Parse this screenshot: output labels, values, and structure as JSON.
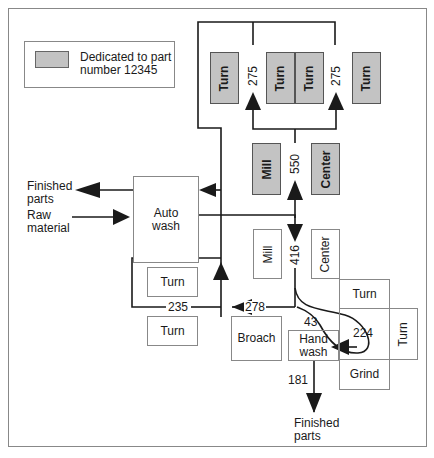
{
  "legend": {
    "label_line1": "Dedicated to part",
    "label_line2": "number 12345",
    "swatch_color": "#c3c3c3"
  },
  "dedicated_cell": {
    "machines": [
      {
        "label": "Turn",
        "dedicated": true
      },
      {
        "label": "Turn",
        "dedicated": true
      },
      {
        "label": "Turn",
        "dedicated": true
      },
      {
        "label": "Turn",
        "dedicated": true
      },
      {
        "label": "Mill",
        "dedicated": true
      },
      {
        "label": "Center",
        "dedicated": true
      }
    ],
    "flows": {
      "left_branch": "275",
      "right_branch": "275",
      "trunk": "550"
    }
  },
  "auto_wash": {
    "label_line1": "Auto",
    "label_line2": "wash"
  },
  "inputs_outputs": {
    "finished_parts_left_line1": "Finished",
    "finished_parts_left_line2": "parts",
    "raw_material_line1": "Raw",
    "raw_material_line2": "material",
    "finished_parts_bottom_line1": "Finished",
    "finished_parts_bottom_line2": "parts"
  },
  "shared_area": {
    "machines": [
      {
        "label": "Mill"
      },
      {
        "label": "Center"
      },
      {
        "label": "Turn"
      },
      {
        "label": "Turn"
      },
      {
        "label": "Turn"
      },
      {
        "label": "Turn"
      },
      {
        "label": "Broach"
      },
      {
        "label": "Grind"
      }
    ],
    "hand_wash": {
      "label_line1": "Hand",
      "label_line2": "wash"
    },
    "flows": {
      "down_flow": "416",
      "left_flow": "278",
      "loop_flow": "235",
      "to_hand_wash": "43",
      "loop_right": "224",
      "out_flow": "181"
    }
  }
}
